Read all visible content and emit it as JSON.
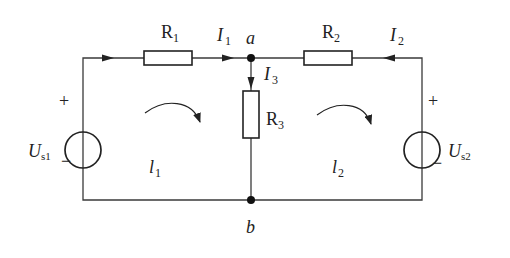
{
  "diagram": {
    "type": "circuit",
    "colors": {
      "wire": "#3a3a3a",
      "component": "#222222",
      "background": "#ffffff"
    },
    "nodes": [
      {
        "id": "a",
        "label": "a"
      },
      {
        "id": "b",
        "label": "b"
      }
    ],
    "resistors": [
      {
        "id": "R1",
        "label": "R",
        "sub": "1"
      },
      {
        "id": "R2",
        "label": "R",
        "sub": "2"
      },
      {
        "id": "R3",
        "label": "R",
        "sub": "3"
      }
    ],
    "sources": [
      {
        "id": "Us1",
        "label": "U",
        "sub": "s1",
        "plus": "+",
        "minus": "−"
      },
      {
        "id": "Us2",
        "label": "U",
        "sub": "s2",
        "plus": "+",
        "minus": "−"
      }
    ],
    "currents": [
      {
        "id": "I1",
        "label": "I",
        "sub": "1"
      },
      {
        "id": "I2",
        "label": "I",
        "sub": "2"
      },
      {
        "id": "I3",
        "label": "I",
        "sub": "3"
      }
    ],
    "loops": [
      {
        "id": "l1",
        "label": "l",
        "sub": "1",
        "direction": "clockwise"
      },
      {
        "id": "l2",
        "label": "l",
        "sub": "2",
        "direction": "clockwise"
      }
    ]
  }
}
